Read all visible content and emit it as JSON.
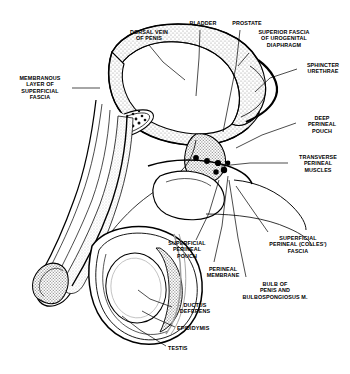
{
  "figure": {
    "type": "anatomical-line-diagram",
    "ink_color": "#000000",
    "stipple_color": "#9a9a9a",
    "background": "#ffffff"
  },
  "labels": [
    {
      "id": "dorsal-vein-of-penis",
      "text": "DORSAL VEIN\nOF PENIS",
      "x": 122,
      "y": 29,
      "w": 54,
      "align": "c"
    },
    {
      "id": "bladder",
      "text": "BLADDER",
      "x": 185,
      "y": 20,
      "w": 36,
      "align": "c"
    },
    {
      "id": "prostate",
      "text": "PROSTATE",
      "x": 228,
      "y": 20,
      "w": 38,
      "align": "c"
    },
    {
      "id": "superior-fascia",
      "text": "SUPERIOR FASCIA\nOF UROGENITAL\nDIAPHRAGM",
      "x": 250,
      "y": 29,
      "w": 68,
      "align": "c"
    },
    {
      "id": "sphincter-urethrae",
      "text": "SPHINCTER\nURETHRAE",
      "x": 300,
      "y": 62,
      "w": 46,
      "align": "c"
    },
    {
      "id": "membranous-layer",
      "text": "MEMBRANOUS\nLAYER OF\nSUPERFICIAL\nFASCIA",
      "x": 10,
      "y": 75,
      "w": 60,
      "align": "c"
    },
    {
      "id": "deep-perineal-pouch",
      "text": "DEEP\nPERINEAL\nPOUCH",
      "x": 300,
      "y": 115,
      "w": 44,
      "align": "c"
    },
    {
      "id": "transverse-perineal-muscles",
      "text": "TRANSVERSE\nPERINEAL\nMUSCLES",
      "x": 290,
      "y": 154,
      "w": 56,
      "align": "c"
    },
    {
      "id": "superficial-perineal-colles-fascia",
      "text": "SUPERFICIAL\nPERINEAL (COLLES')\nFASCIA",
      "x": 258,
      "y": 235,
      "w": 80,
      "align": "c"
    },
    {
      "id": "superficial-perineal-pouch",
      "text": "SUPERFICIAL\nPERINEAL\nPOUCH",
      "x": 163,
      "y": 240,
      "w": 48,
      "align": "c"
    },
    {
      "id": "perineal-membrane",
      "text": "PERINEAL\nMEMBRANE",
      "x": 200,
      "y": 266,
      "w": 46,
      "align": "c"
    },
    {
      "id": "bulb-of-penis",
      "text": "BULB OF\nPENIS AND\nBULBOSPONGIOSUS M.",
      "x": 232,
      "y": 281,
      "w": 86,
      "align": "c"
    },
    {
      "id": "ductus-deferens",
      "text": "DUCTUS\nDEFERENS",
      "x": 174,
      "y": 302,
      "w": 42,
      "align": "c"
    },
    {
      "id": "epididymis",
      "text": "EPIDIDYMIS",
      "x": 177,
      "y": 325,
      "w": 46,
      "align": "l"
    },
    {
      "id": "testis",
      "text": "TESTIS",
      "x": 168,
      "y": 345,
      "w": 30,
      "align": "l"
    }
  ],
  "leaders": [
    {
      "id": "leader-dorsal-vein",
      "points": "149,45 163,62 185,80"
    },
    {
      "id": "leader-bladder",
      "points": "200,30 199,58 196,96"
    },
    {
      "id": "leader-prostate",
      "points": "240,30 236,66 223,132"
    },
    {
      "id": "leader-superior-fascia",
      "points": "249,53 238,66"
    },
    {
      "id": "leader-sphincter-urethrae",
      "points": "297,69 270,78 255,92"
    },
    {
      "id": "leader-membranous-layer",
      "points": "72,88 100,88"
    },
    {
      "id": "leader-deep-pouch",
      "points": "296,123 262,135 236,148"
    },
    {
      "id": "leader-transverse-muscles",
      "points": "288,163 250,163 221,166"
    },
    {
      "id": "leader-colles-fascia",
      "points": "268,232 254,212 236,186"
    },
    {
      "id": "leader-superficial-pouch",
      "points": "196,240 209,213 219,180"
    },
    {
      "id": "leader-perineal-membrane",
      "points": "214,262 222,226 228,176"
    },
    {
      "id": "leader-bulb-of-penis",
      "points": "246,277 238,238 229,180"
    },
    {
      "id": "leader-ductus-deferens",
      "points": "172,307 150,299 138,290"
    },
    {
      "id": "leader-epididymis",
      "points": "175,327 155,318 142,311"
    },
    {
      "id": "leader-testis",
      "points": "166,346 140,330 122,316"
    }
  ]
}
